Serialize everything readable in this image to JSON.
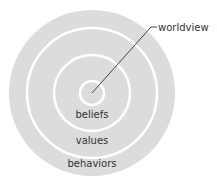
{
  "diagram": {
    "type": "concentric-circles",
    "layers": [
      {
        "label": "worldview",
        "level": 0
      },
      {
        "label": "beliefs",
        "level": 1
      },
      {
        "label": "values",
        "level": 2
      },
      {
        "label": "behaviors",
        "level": 3
      }
    ],
    "callout_label": "worldview",
    "labels": {
      "beliefs": "beliefs",
      "values": "values",
      "behaviors": "behaviors"
    },
    "colors": {
      "fill": "#dcdcdc",
      "ring": "#ffffff",
      "leader": "#333333",
      "text": "#333333"
    }
  }
}
